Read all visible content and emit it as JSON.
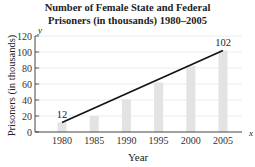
{
  "chart_data": {
    "type": "bar",
    "title": "Number of Female State and Federal Prisoners (in thousands) 1980–2005",
    "title_lines": [
      "Number of Female State and Federal",
      "Prisoners (in thousands) 1980–2005"
    ],
    "xlabel": "Year",
    "ylabel": "Prisoners (in thousands)",
    "x_axis_var": "x",
    "y_axis_var": "y",
    "categories": [
      "1980",
      "1985",
      "1990",
      "1995",
      "2000",
      "2005"
    ],
    "values": [
      12,
      20,
      41,
      62,
      83,
      102
    ],
    "ylim": [
      0,
      120
    ],
    "yticks": [
      0,
      20,
      40,
      60,
      80,
      100,
      120
    ],
    "grid": true,
    "bar_color": "#e3e3e3",
    "overlay_line": {
      "from": {
        "x": "1980",
        "y": 12
      },
      "to": {
        "x": "2005",
        "y": 102
      },
      "color": "#111111"
    },
    "annotations": [
      {
        "x": "1980",
        "text": "12"
      },
      {
        "x": "2005",
        "text": "102"
      }
    ]
  }
}
